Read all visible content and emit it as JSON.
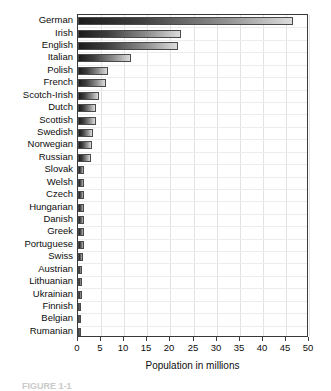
{
  "chart_data": {
    "type": "bar",
    "orientation": "horizontal",
    "title": "",
    "xlabel": "Population in millions",
    "ylabel": "",
    "xlim": [
      0,
      50
    ],
    "xticks": [
      0,
      5,
      10,
      15,
      20,
      25,
      30,
      35,
      40,
      45,
      50
    ],
    "grid": true,
    "legend": null,
    "categories": [
      "German",
      "Irish",
      "English",
      "Italian",
      "Polish",
      "French",
      "Scotch-Irish",
      "Dutch",
      "Scottish",
      "Swedish",
      "Norwegian",
      "Russian",
      "Slovak",
      "Welsh",
      "Czech",
      "Hungarian",
      "Danish",
      "Greek",
      "Portuguese",
      "Swiss",
      "Austrian",
      "Lithuanian",
      "Ukrainian",
      "Finnish",
      "Belgian",
      "Rumanian"
    ],
    "values": [
      46.5,
      22.3,
      21.6,
      11.5,
      6.5,
      6.1,
      4.6,
      4.0,
      4.0,
      3.3,
      3.1,
      2.9,
      1.3,
      1.3,
      1.3,
      1.2,
      1.2,
      1.2,
      1.2,
      1.0,
      0.9,
      0.9,
      0.9,
      0.7,
      0.5,
      0.3
    ]
  },
  "axis": {
    "x_title": "Population in millions"
  },
  "caption": {
    "text": "FIGURE 1-1"
  },
  "colors": {
    "bar_dark": "#1c1c1c",
    "bar_light": "#dcdcdc",
    "bar_border": "#4a4a4a",
    "frame": "#3a3a3a",
    "gridline": "#e2e2e2",
    "text": "#0d0d0d",
    "background": "#ffffff"
  }
}
